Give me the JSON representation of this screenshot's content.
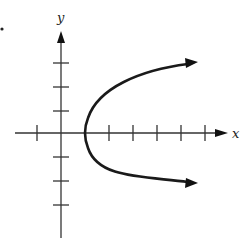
{
  "diagram": {
    "type": "graph-of-relation",
    "axes": {
      "x_label": "x",
      "y_label": "y",
      "origin_px": [
        61,
        133
      ],
      "unit_px": 24,
      "x_ticks": [
        -1,
        1,
        2,
        3,
        4,
        5,
        6
      ],
      "y_ticks": [
        3,
        2,
        1,
        -1,
        -2,
        -3
      ]
    },
    "curve": {
      "vertex": [
        1,
        0
      ],
      "opens": "right",
      "arrows_at_ends": true,
      "color": "#1a1a1a"
    },
    "colors": {
      "axis": "#333333",
      "curve": "#1a1a1a",
      "background": "#ffffff"
    }
  }
}
